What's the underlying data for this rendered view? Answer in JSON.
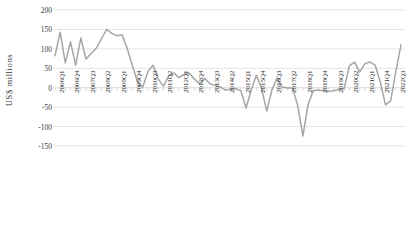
{
  "chart_data": {
    "type": "line",
    "title": "",
    "subtitle": "",
    "xlabel": "",
    "ylabel": "US$ millions",
    "ylim": [
      -150,
      200
    ],
    "ytick_values": [
      200,
      150,
      100,
      50,
      0,
      -50,
      -100,
      -150
    ],
    "ytick_labels": [
      "200",
      "150",
      "100",
      "50",
      "0",
      "-50",
      "-100",
      "-150"
    ],
    "grid": true,
    "grid_axis": "y",
    "legend": false,
    "legend_position": "none",
    "series_color": "#a6a6a6",
    "axis_color": "#d9d9d9",
    "text_color": "#3a3a3a",
    "xtick_labels": [
      "2006Q1",
      "2006Q4",
      "2007Q3",
      "2008Q2",
      "2009Q1",
      "2009Q4",
      "2010Q3",
      "2011Q2",
      "2012Q1",
      "2012Q4",
      "2013Q3",
      "2014Q2",
      "2015Q1",
      "2015Q4",
      "2016Q3",
      "2017Q2",
      "2018Q1",
      "2018Q4",
      "2019Q3",
      "2020Q2",
      "2021Q1",
      "2021Q4",
      "2022Q3"
    ],
    "xtick_interval": 3,
    "categories": [
      "2006Q1",
      "2006Q2",
      "2006Q3",
      "2006Q4",
      "2007Q1",
      "2007Q2",
      "2007Q3",
      "2007Q4",
      "2008Q1",
      "2008Q2",
      "2008Q3",
      "2008Q4",
      "2009Q1",
      "2009Q2",
      "2009Q3",
      "2009Q4",
      "2010Q1",
      "2010Q2",
      "2010Q3",
      "2010Q4",
      "2011Q1",
      "2011Q2",
      "2011Q3",
      "2011Q4",
      "2012Q1",
      "2012Q2",
      "2012Q3",
      "2012Q4",
      "2013Q1",
      "2013Q2",
      "2013Q3",
      "2013Q4",
      "2014Q1",
      "2014Q2",
      "2014Q3",
      "2014Q4",
      "2015Q1",
      "2015Q2",
      "2015Q3",
      "2015Q4",
      "2016Q1",
      "2016Q2",
      "2016Q3",
      "2016Q4",
      "2017Q1",
      "2017Q2",
      "2017Q3",
      "2017Q4",
      "2018Q1",
      "2018Q2",
      "2018Q3",
      "2018Q4",
      "2019Q1",
      "2019Q2",
      "2019Q3",
      "2019Q4",
      "2020Q1",
      "2020Q2",
      "2020Q3",
      "2020Q4",
      "2021Q1",
      "2021Q2",
      "2021Q3",
      "2021Q4",
      "2022Q1",
      "2022Q2",
      "2022Q3",
      "2022Q4"
    ],
    "values": [
      82,
      143,
      64,
      118,
      58,
      128,
      74,
      88,
      102,
      126,
      150,
      140,
      134,
      136,
      100,
      56,
      14,
      2,
      42,
      58,
      22,
      4,
      30,
      38,
      26,
      34,
      38,
      22,
      10,
      24,
      10,
      6,
      2,
      -6,
      -4,
      -2,
      -8,
      -52,
      -6,
      32,
      -2,
      -60,
      -6,
      24,
      2,
      -1,
      -1,
      -46,
      -124,
      -44,
      -8,
      -6,
      -8,
      -10,
      -8,
      -4,
      -2,
      56,
      66,
      40,
      62,
      66,
      58,
      14,
      -44,
      -34,
      42,
      110
    ]
  }
}
